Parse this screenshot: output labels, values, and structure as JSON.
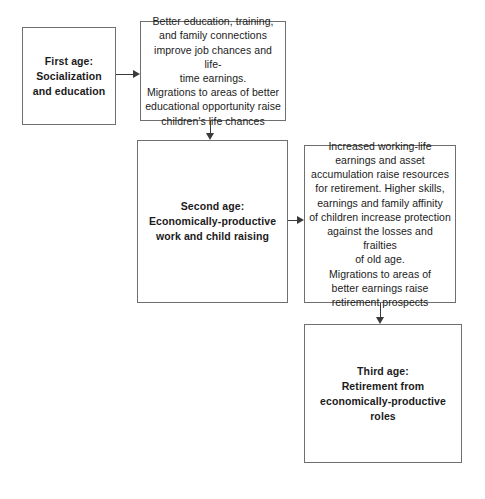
{
  "diagram": {
    "nodes": [
      {
        "id": "first-age",
        "kind": "stage",
        "text": "First age:\nSocialization\nand education"
      },
      {
        "id": "first-detail",
        "kind": "detail",
        "text": "Better education, training,\nand family connections\nimprove job chances and life-\ntime earnings.\nMigrations to areas of better\neducational opportunity raise\nchildren's life chances"
      },
      {
        "id": "second-age",
        "kind": "stage",
        "text": "Second age:\nEconomically-productive\nwork and child raising"
      },
      {
        "id": "second-detail",
        "kind": "detail",
        "text": "Increased working-life\nearnings and asset\naccumulation raise resources\nfor retirement.  Higher skills,\nearnings and family affinity\nof children increase protection\nagainst the losses and frailties\nof old age.\nMigrations to areas of\nbetter earnings raise\nretirement prospects"
      },
      {
        "id": "third-age",
        "kind": "stage",
        "text": "Third age:\nRetirement from\neconomically-productive\nroles"
      }
    ],
    "edges": [
      {
        "id": "first-to-detail",
        "from": "first-age",
        "to": "first-detail",
        "direction": "right"
      },
      {
        "id": "detail-to-second",
        "from": "first-detail",
        "to": "second-age",
        "direction": "down"
      },
      {
        "id": "second-to-detail2",
        "from": "second-age",
        "to": "second-detail",
        "direction": "right"
      },
      {
        "id": "detail2-to-third",
        "from": "second-detail",
        "to": "third-age",
        "direction": "down"
      }
    ],
    "colors": {
      "background": "#ffffff",
      "box_border": "#6f6f6f",
      "connector": "#3a3a3a",
      "text": "#1b1b1b"
    }
  }
}
